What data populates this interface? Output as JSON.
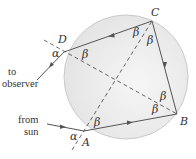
{
  "diagram": {
    "title": "",
    "points": {
      "A": {
        "label": "A",
        "x": 84,
        "y": 131
      },
      "B": {
        "label": "B",
        "x": 177,
        "y": 114
      },
      "C": {
        "label": "C",
        "x": 152,
        "y": 21
      },
      "D": {
        "label": "D",
        "x": 64,
        "y": 52
      }
    },
    "circle": {
      "cx": 126,
      "cy": 77,
      "r": 62,
      "fill": "#ececec",
      "stroke": "#c8c8c8"
    },
    "angles": {
      "alpha": "α",
      "beta": "β"
    },
    "labels": {
      "to_observer_line1": "to",
      "to_observer_line2": "observer",
      "from_sun_line1": "from",
      "from_sun_line2": "sun"
    },
    "colors": {
      "ray": "#555555",
      "dashed": "#555555",
      "text": "#333333"
    }
  }
}
